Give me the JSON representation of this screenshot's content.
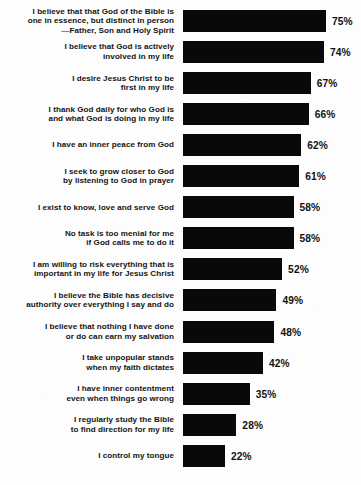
{
  "chart_data": {
    "type": "bar",
    "orientation": "horizontal",
    "title": "",
    "xlabel": "",
    "ylabel": "",
    "xlim": [
      0,
      100
    ],
    "grid": false,
    "legend": null,
    "value_suffix": "%",
    "bar_color": "#090909",
    "background_color": "#fdfdfd",
    "text_color": "#141414",
    "categories": [
      "I believe that that God of the Bible is\none in essence, but distinct in person\n—Father, Son and Holy Spirit",
      "I believe that God is actively\ninvolved in my life",
      "I desire Jesus Christ to be\nfirst in my life",
      "I thank God daily for who God is\nand what God is doing in my life",
      "I have an inner peace from God",
      "I seek to grow closer to God\nby listening to God in prayer",
      "I exist to know, love and serve God",
      "No task is too menial for me\nif God calls me to do it",
      "I am willing to risk everything that is\nimportant in my life for Jesus Christ",
      "I believe the Bible has decisive\nauthority over everything I say and do",
      "I believe that nothing I have done\nor do can earn my salvation",
      "I take unpopular stands\nwhen my faith dictates",
      "I have inner contentment\neven when things go wrong",
      "I regularly study the Bible\nto find direction for my life",
      "I control my tongue"
    ],
    "values": [
      75,
      74,
      67,
      66,
      62,
      61,
      58,
      58,
      52,
      49,
      48,
      42,
      35,
      28,
      22
    ],
    "value_labels": [
      "75%",
      "74%",
      "67%",
      "66%",
      "62%",
      "61%",
      "58%",
      "58%",
      "52%",
      "49%",
      "48%",
      "42%",
      "35%",
      "28%",
      "22%"
    ]
  }
}
